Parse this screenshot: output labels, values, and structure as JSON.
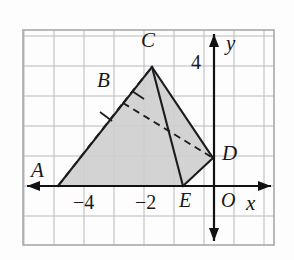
{
  "figure": {
    "kind": "coordinate-grid-solid-diagram",
    "frame": {
      "x": 23,
      "y": 30,
      "width": 251,
      "height": 215
    },
    "grid": {
      "visible": true,
      "spacing_px": 30,
      "line_color": "#b9b9bd",
      "background_color": "#fdfdfd"
    },
    "axes": {
      "origin_px": {
        "x": 214,
        "y": 186
      },
      "x_axis": {
        "label": "x",
        "y_px": 186,
        "arrow_left": true,
        "arrow_right": true
      },
      "y_axis": {
        "label": "y",
        "x_px": 214,
        "arrow_up": true,
        "arrow_down": true
      },
      "tick_labels": [
        {
          "text": "4",
          "axis": "y",
          "x_px": 191,
          "y_px": 52
        },
        {
          "text": "−4",
          "axis": "x",
          "x_px": 73,
          "y_px": 192
        },
        {
          "text": "−2",
          "axis": "x",
          "x_px": 135,
          "y_px": 192
        }
      ],
      "origin_label": "O"
    },
    "solid": {
      "name": "shaded-prism",
      "fill_color": "#cfcfcf",
      "fill_opacity": 0.92,
      "stroke_color": "#1c1c1e",
      "stroke_width": 2.1,
      "hidden_edge_style": "dashed",
      "vertices": [
        {
          "label": "A",
          "x_px": 58,
          "y_px": 186,
          "label_x": 31,
          "label_y": 160
        },
        {
          "label": "B",
          "x_px": 123,
          "y_px": 103,
          "label_x": 97,
          "label_y": 70
        },
        {
          "label": "C",
          "x_px": 152,
          "y_px": 67,
          "label_x": 141,
          "label_y": 30
        },
        {
          "label": "D",
          "x_px": 213,
          "y_px": 158,
          "label_x": 222,
          "label_y": 143
        },
        {
          "label": "E",
          "x_px": 183,
          "y_px": 186,
          "label_x": 179,
          "label_y": 190
        }
      ],
      "solid_edges": [
        [
          "A",
          "C"
        ],
        [
          "C",
          "D"
        ],
        [
          "D",
          "E"
        ],
        [
          "E",
          "A"
        ],
        [
          "C",
          "E"
        ]
      ],
      "hidden_edges": [
        [
          "A",
          "B"
        ],
        [
          "B",
          "C"
        ],
        [
          "B",
          "D"
        ]
      ],
      "tick_marks_on_edges": [
        {
          "edge": [
            "A",
            "C"
          ],
          "count": 1
        },
        {
          "edge": [
            "B",
            "C"
          ],
          "count": 1
        }
      ]
    },
    "labels": {
      "A": "A",
      "B": "B",
      "C": "C",
      "D": "D",
      "E": "E",
      "O": "O",
      "x": "x",
      "y": "y",
      "four": "4",
      "neg_four": "−4",
      "neg_two": "−2"
    }
  }
}
